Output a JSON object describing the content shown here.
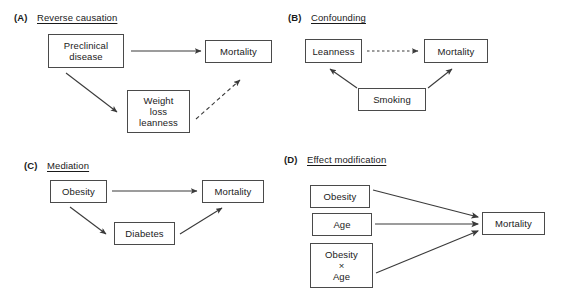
{
  "figure": {
    "background_color": "#ffffff",
    "line_color": "#3a3a3a",
    "box_border_color": "#4a4a4a",
    "text_color": "#1a1a1a"
  },
  "panels": [
    {
      "id": "A",
      "label": "(A)",
      "title": "Reverse causation",
      "nodes": [
        {
          "id": "a-preclinical-disease",
          "text": "Preclinical\ndisease"
        },
        {
          "id": "a-mortality",
          "text": "Mortality"
        },
        {
          "id": "a-weight-loss-leanness",
          "text": "Weight\nloss\nleanness"
        }
      ],
      "edges": [
        {
          "from": "Preclinical disease",
          "to": "Mortality",
          "style": "solid"
        },
        {
          "from": "Preclinical disease",
          "to": "Weight loss leanness",
          "style": "solid"
        },
        {
          "from": "Weight loss leanness",
          "to": "Mortality",
          "style": "dashed"
        }
      ]
    },
    {
      "id": "B",
      "label": "(B)",
      "title": "Confounding",
      "nodes": [
        {
          "id": "b-leanness",
          "text": "Leanness"
        },
        {
          "id": "b-mortality",
          "text": "Mortality"
        },
        {
          "id": "b-smoking",
          "text": "Smoking"
        }
      ],
      "edges": [
        {
          "from": "Leanness",
          "to": "Mortality",
          "style": "dotted"
        },
        {
          "from": "Smoking",
          "to": "Leanness",
          "style": "solid"
        },
        {
          "from": "Smoking",
          "to": "Mortality",
          "style": "solid"
        }
      ]
    },
    {
      "id": "C",
      "label": "(C)",
      "title": "Mediation",
      "nodes": [
        {
          "id": "c-obesity",
          "text": "Obesity"
        },
        {
          "id": "c-mortality",
          "text": "Mortality"
        },
        {
          "id": "c-diabetes",
          "text": "Diabetes"
        }
      ],
      "edges": [
        {
          "from": "Obesity",
          "to": "Mortality",
          "style": "solid"
        },
        {
          "from": "Obesity",
          "to": "Diabetes",
          "style": "solid"
        },
        {
          "from": "Diabetes",
          "to": "Mortality",
          "style": "solid"
        }
      ]
    },
    {
      "id": "D",
      "label": "(D)",
      "title": "Effect modification",
      "nodes": [
        {
          "id": "d-obesity",
          "text": "Obesity"
        },
        {
          "id": "d-age",
          "text": "Age"
        },
        {
          "id": "d-obesity-x-age",
          "text": "Obesity\n×\nAge"
        },
        {
          "id": "d-mortality",
          "text": "Mortality"
        }
      ],
      "edges": [
        {
          "from": "Obesity",
          "to": "Mortality",
          "style": "solid"
        },
        {
          "from": "Age",
          "to": "Mortality",
          "style": "solid"
        },
        {
          "from": "Obesity × Age",
          "to": "Mortality",
          "style": "solid"
        }
      ]
    }
  ]
}
